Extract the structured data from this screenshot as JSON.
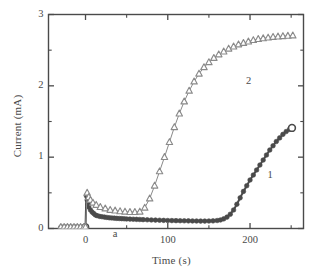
{
  "chart_data": {
    "type": "line",
    "title": "",
    "xlabel": "Time (s)",
    "ylabel": "Current (mA)",
    "xlim": [
      -45,
      265
    ],
    "ylim": [
      0,
      3
    ],
    "grid": false,
    "legend_position": "inline-annotations",
    "x_ticks_major": [
      0,
      100,
      200
    ],
    "x_tick_labels": [
      "0",
      "100",
      "200"
    ],
    "x_ticks_minor": [
      -50,
      50,
      150,
      250
    ],
    "y_ticks_major": [
      0,
      1,
      2,
      3
    ],
    "y_tick_labels": [
      "0",
      "1",
      "2",
      "3"
    ],
    "y_ticks_minor": [
      0.5,
      1.5,
      2.5
    ],
    "annotations": [
      {
        "text": "a",
        "x": 38,
        "y": -0.09
      },
      {
        "text": "1",
        "x": 226,
        "y": 0.73
      },
      {
        "text": "2",
        "x": 200,
        "y": 2.05
      }
    ],
    "series": [
      {
        "name": "1",
        "marker": "filled-circle",
        "color": "#4a4a4a",
        "marker_size": 4.6,
        "x": [
          -30,
          -27,
          -24,
          -21,
          -18,
          -15,
          -12,
          -9,
          -6,
          -3,
          0,
          1,
          2,
          3,
          4,
          6,
          8,
          10,
          12,
          14,
          17,
          20,
          23,
          26,
          29,
          32,
          35,
          38,
          41,
          44,
          47,
          50,
          54,
          58,
          62,
          66,
          70,
          75,
          80,
          85,
          90,
          95,
          100,
          105,
          110,
          115,
          120,
          125,
          130,
          135,
          140,
          145,
          150,
          155,
          160,
          164,
          168,
          172,
          176,
          180,
          184,
          188,
          192,
          196,
          200,
          204,
          208,
          212,
          216,
          220,
          224,
          228,
          232,
          236,
          240,
          244,
          248,
          251
        ],
        "y": [
          0.02,
          0.02,
          0.02,
          0.02,
          0.02,
          0.02,
          0.02,
          0.02,
          0.02,
          0.02,
          0.02,
          0.46,
          0.4,
          0.34,
          0.3,
          0.26,
          0.23,
          0.21,
          0.19,
          0.18,
          0.17,
          0.165,
          0.16,
          0.155,
          0.15,
          0.148,
          0.145,
          0.142,
          0.14,
          0.138,
          0.136,
          0.134,
          0.132,
          0.13,
          0.128,
          0.126,
          0.124,
          0.122,
          0.12,
          0.118,
          0.116,
          0.114,
          0.112,
          0.111,
          0.11,
          0.109,
          0.108,
          0.107,
          0.106,
          0.105,
          0.104,
          0.104,
          0.105,
          0.107,
          0.112,
          0.12,
          0.135,
          0.16,
          0.2,
          0.26,
          0.34,
          0.43,
          0.52,
          0.6,
          0.68,
          0.75,
          0.82,
          0.89,
          0.96,
          1.03,
          1.1,
          1.16,
          1.22,
          1.27,
          1.32,
          1.36,
          1.39,
          1.41
        ]
      },
      {
        "name": "2",
        "marker": "open-triangle",
        "color": "#8a8a8a",
        "marker_size": 6.4,
        "x": [
          -30,
          -26,
          -22,
          -18,
          -14,
          -10,
          -6,
          -2,
          0,
          2,
          4,
          6,
          9,
          13,
          18,
          24,
          30,
          36,
          42,
          48,
          54,
          60,
          66,
          72,
          78,
          84,
          90,
          96,
          102,
          108,
          114,
          120,
          126,
          132,
          138,
          144,
          150,
          156,
          162,
          168,
          174,
          180,
          186,
          192,
          198,
          204,
          210,
          216,
          222,
          228,
          234,
          240,
          246,
          252
        ],
        "y": [
          0.02,
          0.02,
          0.02,
          0.02,
          0.02,
          0.02,
          0.02,
          0.02,
          0.02,
          0.5,
          0.44,
          0.4,
          0.36,
          0.33,
          0.3,
          0.28,
          0.26,
          0.25,
          0.24,
          0.235,
          0.23,
          0.23,
          0.235,
          0.29,
          0.42,
          0.6,
          0.8,
          1.0,
          1.21,
          1.42,
          1.61,
          1.78,
          1.93,
          2.06,
          2.17,
          2.26,
          2.33,
          2.39,
          2.44,
          2.48,
          2.52,
          2.55,
          2.58,
          2.6,
          2.62,
          2.64,
          2.655,
          2.665,
          2.675,
          2.685,
          2.69,
          2.695,
          2.7,
          2.705
        ]
      }
    ]
  },
  "axes": {
    "frame_color": "#4a4a4a"
  }
}
